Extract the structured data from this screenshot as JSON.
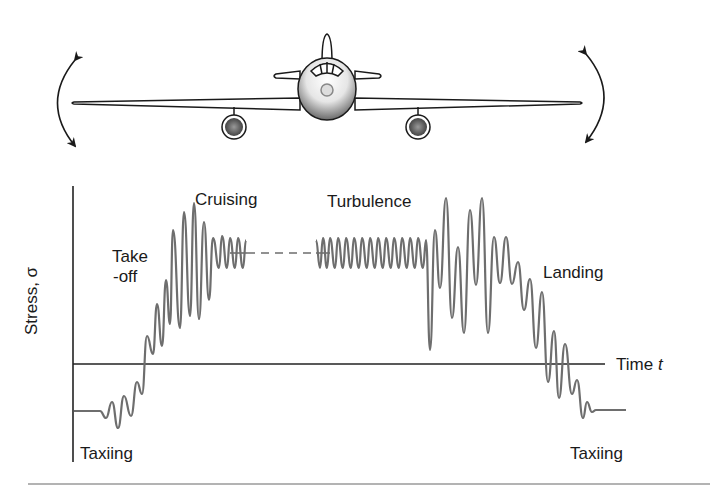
{
  "figure": {
    "airplane": {
      "description": "front view of aircraft with wing flexing arrows",
      "icons": [
        "curved-double-arrow-left",
        "curved-double-arrow-right",
        "airplane-front-view"
      ]
    },
    "axes": {
      "ylabel": "Stress, σ",
      "xlabel_text": "Time ",
      "xlabel_var": "t"
    },
    "annotations": {
      "takeoff_line1": "Take",
      "takeoff_line2": "-off",
      "cruising": "Cruising",
      "turbulence": "Turbulence",
      "landing": "Landing",
      "taxiing_start": "Taxiing",
      "taxiing_end": "Taxiing"
    },
    "colors": {
      "signal": "#6e6e6e",
      "axis": "#222222",
      "rule": "#9a9a9a"
    }
  },
  "chart_data": {
    "type": "line",
    "title": "",
    "xlabel": "Time t",
    "ylabel": "Stress, σ",
    "phases": [
      "Taxiing",
      "Take-off",
      "Cruising",
      "Turbulence",
      "Landing",
      "Taxiing"
    ],
    "series": [
      {
        "name": "stress_signal",
        "description": "oscillating stress: flat negative during taxi, rising oscillations during take-off, steady small oscillation during cruise (gap shown dashed), large irregular oscillations during turbulence, descending oscillations during landing, flat negative during final taxi"
      }
    ],
    "baseline_levels": {
      "taxi": -1,
      "cruise": 2,
      "zero_axis": 0
    }
  }
}
